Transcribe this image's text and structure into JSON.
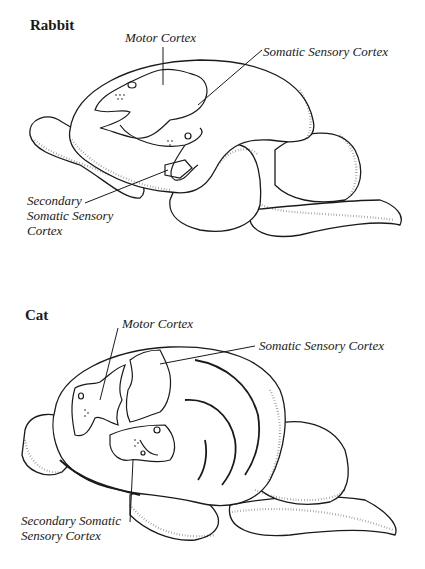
{
  "figures": [
    {
      "id": "rabbit",
      "title": "Rabbit",
      "labels": {
        "motor": "Motor Cortex",
        "somatic": "Somatic Sensory Cortex",
        "secondary_lines": [
          "Secondary",
          "Somatic Sensory",
          "Cortex"
        ]
      }
    },
    {
      "id": "cat",
      "title": "Cat",
      "labels": {
        "motor": "Motor Cortex",
        "somatic": "Somatic Sensory Cortex",
        "secondary_lines": [
          "Secondary Somatic",
          "Sensory Cortex"
        ]
      }
    }
  ],
  "colors": {
    "ink": "#1a1a1a",
    "paper": "#ffffff"
  }
}
